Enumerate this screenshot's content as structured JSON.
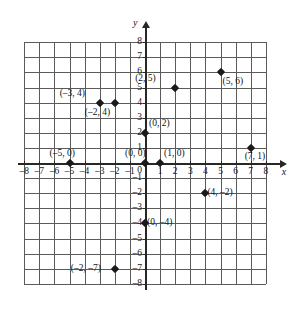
{
  "figure": {
    "type": "coordinate-plane",
    "axis_labels": {
      "x": "x",
      "y": "y"
    },
    "origin_label": "0"
  },
  "chart_data": {
    "type": "scatter",
    "title": "",
    "xlabel": "x",
    "ylabel": "y",
    "xlim": [
      -8,
      8
    ],
    "ylim": [
      -8,
      8
    ],
    "grid": true,
    "legend": "none",
    "x_ticks": [
      -8,
      -7,
      -6,
      -5,
      -4,
      -3,
      -2,
      -1,
      1,
      2,
      3,
      4,
      5,
      6,
      7,
      8
    ],
    "y_ticks": [
      8,
      7,
      6,
      5,
      4,
      3,
      2,
      1,
      -1,
      -2,
      -3,
      -4,
      -5,
      -6,
      -7,
      -8
    ],
    "x_tick_labels": [
      "–8",
      "–7",
      "–6",
      "–5",
      "–4",
      "–3",
      "–2",
      "–1",
      "1",
      "2",
      "3",
      "4",
      "5",
      "6",
      "7",
      "8"
    ],
    "y_tick_labels": [
      "8",
      "7",
      "6",
      "5",
      "4",
      "3",
      "2",
      "1",
      "–1",
      "–2",
      "–3",
      "–4",
      "–5",
      "–6",
      "–7",
      "–8"
    ],
    "points": [
      {
        "x": -3,
        "y": 4,
        "label": "(–3, 4)",
        "label_pos": "left-above"
      },
      {
        "x": -2,
        "y": 4,
        "label": "(–2, 4)",
        "label_pos": "left-below"
      },
      {
        "x": 2,
        "y": 5,
        "label": "(2, 5)",
        "label_pos": "left-above"
      },
      {
        "x": 5,
        "y": 6,
        "label": "(5, 6)",
        "label_pos": "right-below"
      },
      {
        "x": 0,
        "y": 2,
        "label": "(0, 2)",
        "label_pos": "right-above"
      },
      {
        "x": -5,
        "y": 0,
        "label": "(–5, 0)",
        "label_pos": "above"
      },
      {
        "x": 0,
        "y": 0,
        "label": "(0, 0)",
        "label_pos": "above"
      },
      {
        "x": 1,
        "y": 0,
        "label": "(1, 0)",
        "label_pos": "right-above"
      },
      {
        "x": 7,
        "y": 1,
        "label": "(7, 1)",
        "label_pos": "below"
      },
      {
        "x": 4,
        "y": -2,
        "label": "(4, –2)",
        "label_pos": "right"
      },
      {
        "x": 0,
        "y": -4,
        "label": "(0, –4)",
        "label_pos": "right"
      },
      {
        "x": -2,
        "y": -7,
        "label": "(–2, –7)",
        "label_pos": "left"
      }
    ]
  },
  "geometry": {
    "origin_px": {
      "x": 145,
      "y": 163
    },
    "unit_px": 15.1,
    "grid_min": -8,
    "grid_max": 8
  },
  "colors": {
    "axis": "#272727",
    "grid": "#5a5a5a",
    "point": "#1a1a1a",
    "text": "#141414",
    "background": "#ffffff"
  }
}
